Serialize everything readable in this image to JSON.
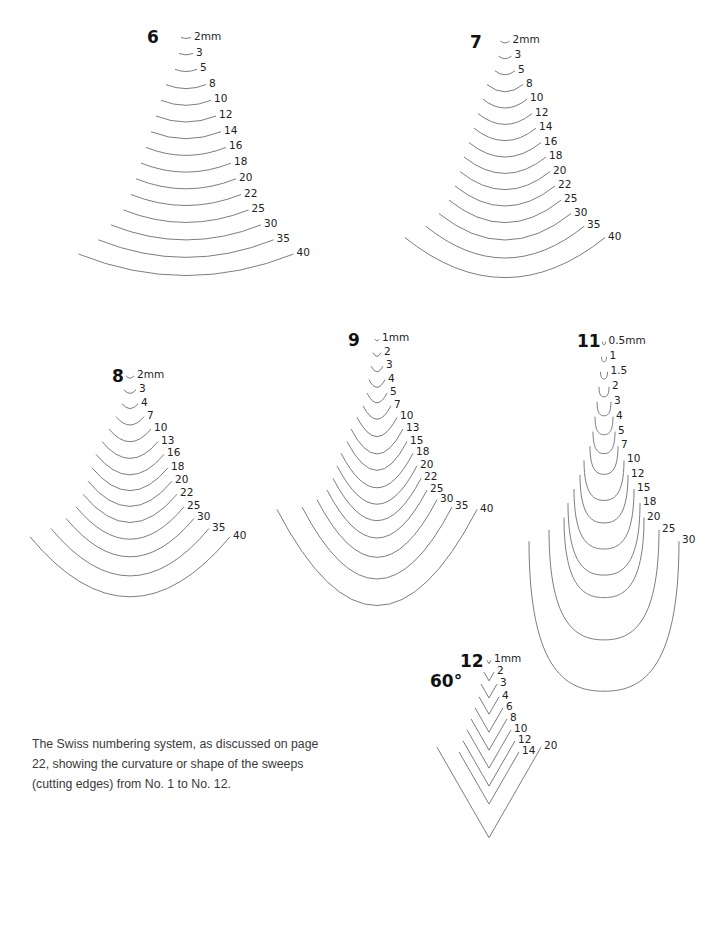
{
  "caption": "The Swiss numbering system, as discussed on page 22, showing the curvature or shape of the sweeps (cutting edges) from No. 1 to No. 12.",
  "stroke_color": "#6e6e6e",
  "groups": [
    {
      "sweep": "6",
      "shape": "arc",
      "label_pos": [
        147,
        38
      ],
      "center_x": 186,
      "top_y": 38,
      "step_y": 16.2,
      "depth_ratio": 0.1,
      "sizes": [
        "2mm",
        "3",
        "5",
        "8",
        "10",
        "12",
        "14",
        "16",
        "18",
        "20",
        "22",
        "25",
        "30",
        "35",
        "40"
      ],
      "widths": [
        10,
        14,
        22,
        40,
        50,
        60,
        70,
        80,
        90,
        100,
        110,
        125,
        150,
        175,
        215
      ]
    },
    {
      "sweep": "7",
      "shape": "arc",
      "label_pos": [
        470,
        43
      ],
      "center_x": 505,
      "top_y": 42,
      "step_y": 15.4,
      "depth_ratio": 0.2,
      "sizes": [
        "2mm",
        "3",
        "5",
        "8",
        "10",
        "12",
        "14",
        "16",
        "18",
        "20",
        "22",
        "25",
        "30",
        "35",
        "40"
      ],
      "widths": [
        9,
        13,
        20,
        36,
        44,
        54,
        62,
        72,
        82,
        90,
        100,
        112,
        132,
        158,
        200
      ]
    },
    {
      "sweep": "8",
      "shape": "arc",
      "label_pos": [
        112,
        377
      ],
      "center_x": 130,
      "top_y": 377,
      "step_y": 14.6,
      "depth_ratio": 0.3,
      "sizes": [
        "2mm",
        "3",
        "4",
        "7",
        "10",
        "13",
        "16",
        "18",
        "20",
        "22",
        "25",
        "30",
        "35",
        "40"
      ],
      "widths": [
        8,
        12,
        16,
        28,
        42,
        56,
        68,
        76,
        84,
        94,
        108,
        128,
        158,
        200
      ]
    },
    {
      "sweep": "9",
      "shape": "arc",
      "label_pos": [
        348,
        341
      ],
      "center_x": 377,
      "top_y": 340,
      "step_y": 14.5,
      "depth_ratio": 0.48,
      "sizes": [
        "1mm",
        "2",
        "3",
        "4",
        "5",
        "7",
        "10",
        "13",
        "15",
        "18",
        "20",
        "22",
        "25",
        "30",
        "35",
        "40"
      ],
      "widths": [
        4,
        8,
        12,
        16,
        20,
        28,
        40,
        52,
        60,
        72,
        80,
        88,
        100,
        120,
        150,
        200
      ]
    },
    {
      "sweep": "11",
      "shape": "u",
      "label_pos": [
        577,
        342
      ],
      "center_x": 604,
      "top_y": 342,
      "step_y": 15.3,
      "depth_ratio": 1.0,
      "sizes": [
        "0.5mm",
        "1",
        "1.5",
        "2",
        "3",
        "4",
        "5",
        "7",
        "10",
        "12",
        "15",
        "18",
        "20",
        "25",
        "30"
      ],
      "widths": [
        3,
        5,
        7,
        10,
        14,
        18,
        22,
        28,
        40,
        48,
        60,
        72,
        80,
        110,
        150
      ]
    },
    {
      "sweep": "12",
      "sweep_angle": "60°",
      "shape": "v",
      "label_pos": [
        460,
        662
      ],
      "center_x": 489,
      "top_y": 662,
      "step_y": 14.5,
      "depth_ratio": 0.87,
      "sizes": [
        "1mm",
        "2",
        "3",
        "4",
        "6",
        "8",
        "10",
        "12",
        "14",
        "20"
      ],
      "widths": [
        4,
        10,
        16,
        20,
        28,
        36,
        44,
        52,
        60,
        104
      ]
    }
  ]
}
